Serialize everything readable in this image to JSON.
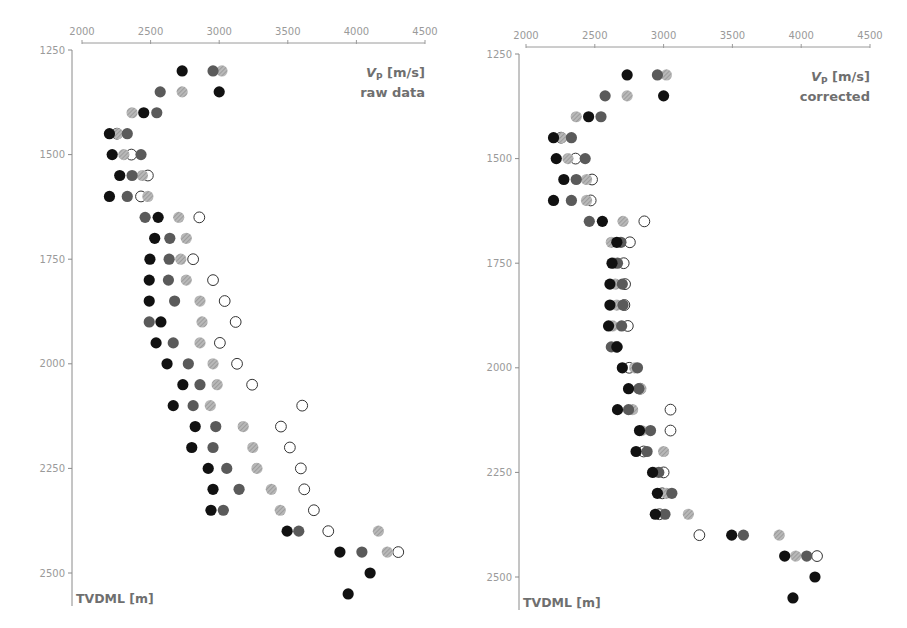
{
  "chart_data": [
    {
      "type": "scatter",
      "panel": "left",
      "title": "Vp [m/s]",
      "subtitle": "raw data",
      "xlabel": "Vp [m/s]",
      "ylabel": "TVDML [m]",
      "xlim": [
        2000,
        4500
      ],
      "ylim": [
        1250,
        2550
      ],
      "y_inverted": true,
      "x_axis_position": "top",
      "xticks": [
        2000,
        2500,
        3000,
        3500,
        4000,
        4500
      ],
      "yticks": [
        1250,
        1500,
        1750,
        2000,
        2250,
        2500
      ],
      "grid": false,
      "legend": "none",
      "y": [
        1300,
        1350,
        1400,
        1450,
        1500,
        1550,
        1600,
        1650,
        1700,
        1750,
        1800,
        1850,
        1900,
        1950,
        2000,
        2050,
        2100,
        2150,
        2200,
        2250,
        2300,
        2350,
        2400,
        2450,
        2500,
        2550
      ],
      "series": [
        {
          "name": "black",
          "color": "#111111",
          "style": "filled",
          "values": [
            2730,
            3000,
            2450,
            2200,
            2220,
            2275,
            2200,
            2555,
            2530,
            2495,
            2490,
            2490,
            2575,
            2540,
            2620,
            2735,
            2665,
            2825,
            2800,
            2920,
            2955,
            2940,
            3495,
            3880,
            4100,
            3940
          ]
        },
        {
          "name": "dark grey",
          "color": "#5a5a5a",
          "style": "filled",
          "values": [
            2955,
            2570,
            2545,
            2330,
            2430,
            2365,
            2330,
            2460,
            2640,
            2635,
            2630,
            2675,
            2490,
            2665,
            2775,
            2860,
            2810,
            2975,
            2955,
            3055,
            3145,
            3030,
            3580,
            4040,
            null,
            null
          ]
        },
        {
          "name": "light grey",
          "color": "#a8a8a8",
          "style": "hatched",
          "values": [
            3020,
            2730,
            2365,
            2260,
            2305,
            2440,
            2480,
            2705,
            2760,
            2720,
            2760,
            2860,
            2875,
            2860,
            2955,
            2985,
            2935,
            3175,
            3245,
            3275,
            3380,
            3445,
            4160,
            4225,
            null,
            null
          ]
        },
        {
          "name": "open",
          "color": "#ffffff",
          "style": "open",
          "values": [
            null,
            null,
            null,
            2255,
            2360,
            2480,
            2430,
            2855,
            null,
            2810,
            2955,
            3040,
            3120,
            3005,
            3130,
            3240,
            3605,
            3450,
            3515,
            3595,
            3620,
            3690,
            3795,
            4305,
            null,
            null
          ]
        }
      ]
    },
    {
      "type": "scatter",
      "panel": "right",
      "title": "Vp [m/s]",
      "subtitle": "corrected",
      "xlabel": "Vp [m/s]",
      "ylabel": "TVDML [m]",
      "xlim": [
        2000,
        4500
      ],
      "ylim": [
        1250,
        2550
      ],
      "y_inverted": true,
      "x_axis_position": "top",
      "xticks": [
        2000,
        2500,
        3000,
        3500,
        4000,
        4500
      ],
      "yticks": [
        1250,
        1500,
        1750,
        2000,
        2250,
        2500
      ],
      "grid": false,
      "legend": "none",
      "y": [
        1300,
        1350,
        1400,
        1450,
        1500,
        1550,
        1600,
        1650,
        1700,
        1750,
        1800,
        1850,
        1900,
        1950,
        2000,
        2050,
        2100,
        2150,
        2200,
        2250,
        2300,
        2350,
        2400,
        2450,
        2500,
        2550
      ],
      "series": [
        {
          "name": "black",
          "color": "#111111",
          "style": "filled",
          "values": [
            2735,
            3000,
            2455,
            2200,
            2220,
            2275,
            2200,
            2555,
            2660,
            2625,
            2610,
            2610,
            2600,
            2660,
            2700,
            2745,
            2665,
            2825,
            2800,
            2920,
            2955,
            2940,
            3495,
            3880,
            4100,
            3940
          ]
        },
        {
          "name": "dark grey",
          "color": "#5a5a5a",
          "style": "filled",
          "values": [
            2955,
            2575,
            2545,
            2330,
            2430,
            2365,
            2330,
            2460,
            2690,
            2665,
            2700,
            2705,
            2695,
            2620,
            2810,
            2820,
            2745,
            2905,
            2880,
            2965,
            3060,
            3010,
            3580,
            4040,
            null,
            null
          ]
        },
        {
          "name": "light grey",
          "color": "#a8a8a8",
          "style": "hatched",
          "values": [
            3020,
            2735,
            2365,
            2260,
            2305,
            2440,
            2440,
            2705,
            2620,
            2640,
            2650,
            2660,
            2630,
            2655,
            2790,
            2835,
            2775,
            2840,
            3000,
            2930,
            3020,
            3180,
            3840,
            3960,
            null,
            null
          ]
        },
        {
          "name": "open",
          "color": "#ffffff",
          "style": "open",
          "values": [
            null,
            null,
            null,
            2255,
            2360,
            2480,
            2470,
            2860,
            2755,
            2710,
            2720,
            2715,
            2740,
            2660,
            2750,
            2830,
            3050,
            3050,
            2855,
            3000,
            2990,
            2970,
            3260,
            4115,
            null,
            null
          ]
        }
      ]
    }
  ],
  "panels": [
    {
      "title_line1": "Vp [m/s]",
      "title_line2": "raw data",
      "ylabel": "TVDML [m]"
    },
    {
      "title_line1": "Vp [m/s]",
      "title_line2": "corrected",
      "ylabel": "TVDML [m]"
    }
  ]
}
